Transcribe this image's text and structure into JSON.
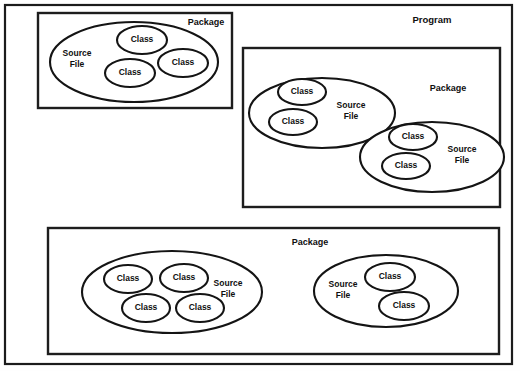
{
  "diagram": {
    "title": "Program",
    "labels": {
      "program": "Program",
      "package": "Package",
      "source_file_line1": "Source",
      "source_file_line2": "File",
      "class": "Class"
    },
    "program": {
      "label": "Program",
      "packages": [
        {
          "id": "package-top-left",
          "label": "Package",
          "source_files": [
            {
              "id": "source-file-1",
              "label_line1": "Source",
              "label_line2": "File",
              "classes": [
                {
                  "id": "class-1",
                  "label": "Class"
                },
                {
                  "id": "class-2",
                  "label": "Class"
                },
                {
                  "id": "class-3",
                  "label": "Class"
                }
              ]
            }
          ]
        },
        {
          "id": "package-right",
          "label": "Package",
          "source_files": [
            {
              "id": "source-file-2",
              "label_line1": "Source",
              "label_line2": "File",
              "classes": [
                {
                  "id": "class-4",
                  "label": "Class"
                },
                {
                  "id": "class-5",
                  "label": "Class"
                }
              ]
            },
            {
              "id": "source-file-3",
              "label_line1": "Source",
              "label_line2": "File",
              "classes": [
                {
                  "id": "class-6",
                  "label": "Class"
                },
                {
                  "id": "class-7",
                  "label": "Class"
                }
              ]
            }
          ]
        },
        {
          "id": "package-bottom",
          "label": "Package",
          "source_files": [
            {
              "id": "source-file-4",
              "label_line1": "Source",
              "label_line2": "File",
              "classes": [
                {
                  "id": "class-8",
                  "label": "Class"
                },
                {
                  "id": "class-9",
                  "label": "Class"
                },
                {
                  "id": "class-10",
                  "label": "Class"
                },
                {
                  "id": "class-11",
                  "label": "Class"
                }
              ]
            },
            {
              "id": "source-file-5",
              "label_line1": "Source",
              "label_line2": "File",
              "classes": [
                {
                  "id": "class-12",
                  "label": "Class"
                },
                {
                  "id": "class-13",
                  "label": "Class"
                }
              ]
            }
          ]
        }
      ]
    },
    "colors": {
      "stroke": "#141414",
      "background": "#ffffff",
      "text": "#0f0f0f"
    }
  }
}
